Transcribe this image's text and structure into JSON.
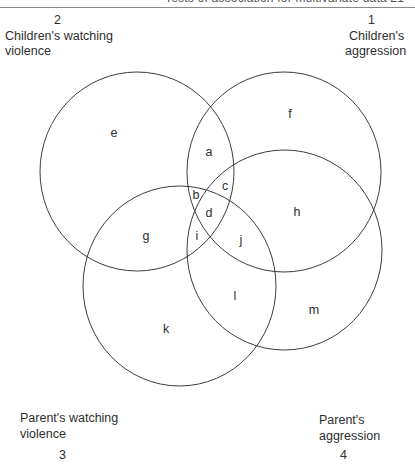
{
  "header": {
    "running_head": "Tests of association for multivariate data   21"
  },
  "variables": [
    {
      "id": "1",
      "number": "1",
      "label_lines": [
        "Children's",
        "aggression"
      ]
    },
    {
      "id": "2",
      "number": "2",
      "label_lines": [
        "Children's watching",
        "violence"
      ]
    },
    {
      "id": "3",
      "number": "3",
      "label_lines": [
        "Parent's watching",
        "violence"
      ]
    },
    {
      "id": "4",
      "number": "4",
      "label_lines": [
        "Parent's",
        "aggression"
      ]
    }
  ],
  "circles": [
    {
      "variable": "1",
      "cx": 284,
      "cy": 172,
      "rx": 97,
      "ry": 100
    },
    {
      "variable": "2",
      "cx": 137,
      "cy": 171.5,
      "rx": 97,
      "ry": 99.5
    },
    {
      "variable": "3",
      "cx": 179.5,
      "cy": 286,
      "rx": 96.5,
      "ry": 100
    },
    {
      "variable": "4",
      "cx": 284.5,
      "cy": 250,
      "rx": 97.5,
      "ry": 100
    }
  ],
  "regions": [
    {
      "label": "a",
      "x": 209,
      "y": 152
    },
    {
      "label": "b",
      "x": 196,
      "y": 195
    },
    {
      "label": "c",
      "x": 225,
      "y": 186
    },
    {
      "label": "d",
      "x": 209,
      "y": 213
    },
    {
      "label": "e",
      "x": 114,
      "y": 133
    },
    {
      "label": "f",
      "x": 290,
      "y": 114
    },
    {
      "label": "g",
      "x": 146,
      "y": 236
    },
    {
      "label": "h",
      "x": 297,
      "y": 212
    },
    {
      "label": "i",
      "x": 197,
      "y": 236
    },
    {
      "label": "j",
      "x": 241,
      "y": 240
    },
    {
      "label": "k",
      "x": 166,
      "y": 329
    },
    {
      "label": "l",
      "x": 235,
      "y": 296
    },
    {
      "label": "m",
      "x": 314,
      "y": 310
    }
  ],
  "colors": {
    "stroke": "#3c3c3c",
    "text": "#2e2e2e",
    "background": "#ffffff"
  }
}
